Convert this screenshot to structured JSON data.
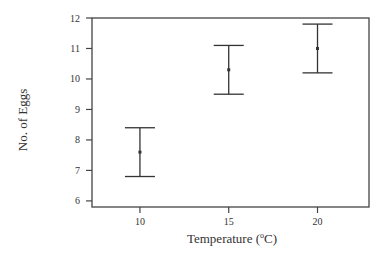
{
  "chart_data": {
    "type": "errorbar",
    "title": "",
    "xlabel": "Temperature (°C)",
    "xlabel_parts": {
      "prefix": "Temperature (",
      "sup": "o",
      "suffix": "C)"
    },
    "ylabel": "No. of Eggs",
    "categories": [
      "10",
      "15",
      "20"
    ],
    "x": [
      10,
      15,
      20
    ],
    "series": [
      {
        "name": "No. of Eggs",
        "mean": [
          7.6,
          10.3,
          11.0
        ],
        "lower": [
          6.8,
          9.5,
          10.2
        ],
        "upper": [
          8.4,
          11.1,
          11.8
        ]
      }
    ],
    "xlim": [
      7.3,
      22.9
    ],
    "ylim": [
      5.8,
      12.0
    ],
    "yticks": [
      6,
      7,
      8,
      9,
      10,
      11,
      12
    ],
    "xticks": [
      10,
      15,
      20
    ],
    "grid": false,
    "legend": null
  },
  "colors": {
    "axis": "#444444",
    "bar": "#333333",
    "text": "#333333"
  }
}
